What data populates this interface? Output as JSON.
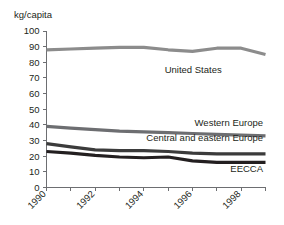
{
  "chart_data": {
    "type": "line",
    "title": "",
    "subtitle": "",
    "xlabel": "",
    "ylabel": "kg/capita",
    "ylim": [
      0,
      100
    ],
    "xlim": [
      1990,
      1999
    ],
    "grid": false,
    "legend_position": "inline-right",
    "y_ticks": [
      "0",
      "10",
      "20",
      "30",
      "40",
      "50",
      "60",
      "70",
      "80",
      "90",
      "100"
    ],
    "y_tick_values": [
      0,
      10,
      20,
      30,
      40,
      50,
      60,
      70,
      80,
      90,
      100
    ],
    "x_ticks": [
      "1990",
      "1992",
      "1994",
      "1996",
      "1998"
    ],
    "x_tick_values": [
      1990,
      1992,
      1994,
      1996,
      1998
    ],
    "x_all_tick_values": [
      1990,
      1991,
      1992,
      1993,
      1994,
      1995,
      1996,
      1997,
      1998,
      1999
    ],
    "x": [
      1990,
      1991,
      1992,
      1993,
      1994,
      1995,
      1996,
      1997,
      1998,
      1999
    ],
    "series": [
      {
        "name": "United States",
        "color": "#8c8c8c",
        "width": 3.2,
        "values": [
          88,
          88.5,
          89,
          89.5,
          89.5,
          88,
          87,
          89,
          89,
          85
        ],
        "label_x": 1997.2,
        "label_y": 73
      },
      {
        "name": "Western Europe",
        "color": "#6d6e71",
        "width": 3.2,
        "values": [
          39,
          38,
          37,
          36,
          35.5,
          35,
          34.5,
          34,
          33.5,
          33
        ],
        "label_x": 1998.9,
        "label_y": 39
      },
      {
        "name": "Central and eastern Europe",
        "color": "#3b3b3b",
        "width": 3.2,
        "values": [
          28,
          26,
          24,
          23.5,
          23.5,
          23,
          22,
          21.5,
          21.5,
          21.5
        ],
        "label_x": 1998.9,
        "label_y": 29.5
      },
      {
        "name": "EECCA",
        "color": "#231f20",
        "width": 3.2,
        "values": [
          23,
          22,
          20.5,
          19.5,
          19,
          19.5,
          17,
          16,
          16,
          16
        ],
        "label_x": 1998.9,
        "label_y": 10
      }
    ]
  }
}
